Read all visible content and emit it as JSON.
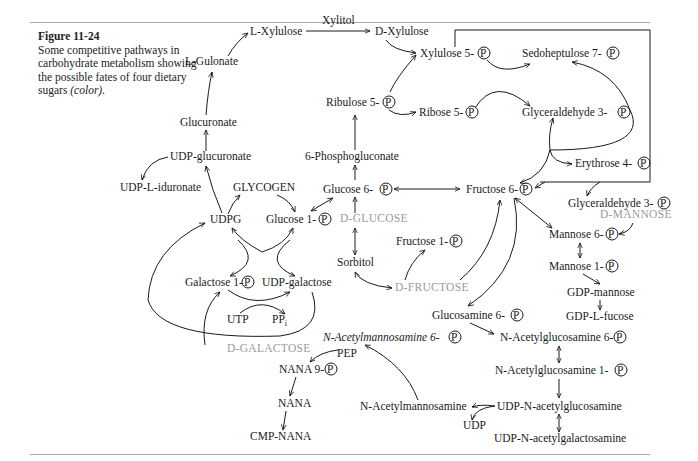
{
  "figure": {
    "label": "Figure 11-24",
    "caption_main": "Some competitive pathways in carbohydrate metabolism showing the possible fates of four dietary sugars",
    "caption_color": "(color)."
  },
  "phosphate_symbol": "P",
  "nodes": {
    "l_gulonate": "L-Gulonate",
    "l_xylulose": "L-Xylulose",
    "xylitol": "Xylitol",
    "d_xylulose": "D-Xylulose",
    "xylulose_5p": "Xylulose 5-",
    "sedoheptulose_7p": "Sedoheptulose 7-",
    "ribulose_5p": "Ribulose 5-",
    "ribose_5p": "Ribose 5-",
    "glyceraldehyde_3p_top": "Glyceraldehyde 3-",
    "glucuronate": "Glucuronate",
    "udp_glucuronate": "UDP-glucuronate",
    "phosphogluconate": "6-Phosphogluconate",
    "erythrose_4p": "Erythrose 4-",
    "udp_l_iduronate": "UDP-L-iduronate",
    "glycogen": "GLYCOGEN",
    "glucose_6p": "Glucose 6-",
    "fructose_6p": "Fructose 6-",
    "udpg": "UDPG",
    "glucose_1p": "Glucose 1-",
    "glyceraldehyde_3p_right": "Glyceraldehyde 3-",
    "mannose_6p": "Mannose 6-",
    "fructose_1p": "Fructose 1-",
    "sorbitol": "Sorbitol",
    "galactose_1p": "Galactose 1-",
    "udp_galactose": "UDP-galactose",
    "mannose_1p": "Mannose 1-",
    "gdp_mannose": "GDP-mannose",
    "gdp_l_fucose": "GDP-L-fucose",
    "utp": "UTP",
    "ppi": "PP",
    "ppi_sub": "i",
    "glucosamine_6p": "Glucosamine 6-",
    "n_acetylmannosamine_6p": "N-Acetylmannosamine 6-",
    "n_acetylglucosamine_6p": "N-Acetylglucosamine 6-",
    "pep": "PEP",
    "nana_9p": "NANA 9-",
    "n_acetylglucosamine_1p": "N-Acetylglucosamine 1-",
    "nana": "NANA",
    "n_acetylmannosamine": "N-Acetylmannosamine",
    "udp_n_acetylglucosamine": "UDP-N-acetylglucosamine",
    "udp": "UDP",
    "cmp_nana": "CMP-NANA",
    "udp_n_acetylgalactosamine": "UDP-N-acetylgalactosamine"
  },
  "dietary_sugars": {
    "d_glucose": "D-GLUCOSE",
    "d_fructose": "D-FRUCTOSE",
    "d_mannose": "D-MANNOSE",
    "d_galactose": "D-GALACTOSE"
  },
  "colors": {
    "text": "#1a1a1a",
    "dietary_sugar": "#9a9a9a",
    "rule": "#a8a8a8"
  }
}
